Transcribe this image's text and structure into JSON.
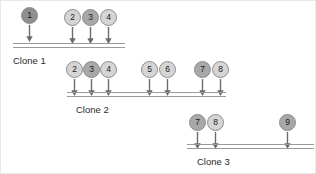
{
  "diagram": {
    "background": "#ffffff",
    "shades": {
      "light": "#d5d5d5",
      "mid": "#a8a8a8",
      "dark": "#8f8f8f",
      "stroke": "#8d8d8d",
      "rail": "#9a9a9a",
      "text": "#2b2b2b"
    },
    "rows": [
      {
        "name": "clone-1",
        "label": "Clone 1",
        "label_x": 12,
        "label_y": 54,
        "rail_x": 12,
        "rail_y": 42,
        "rail_w": 112,
        "nodes": [
          {
            "id": "1",
            "x": 20,
            "y": 6,
            "shade": "dark"
          },
          {
            "id": "2",
            "x": 63,
            "y": 8,
            "shade": "light"
          },
          {
            "id": "3",
            "x": 81,
            "y": 8,
            "shade": "mid"
          },
          {
            "id": "4",
            "x": 99,
            "y": 8,
            "shade": "light"
          }
        ],
        "arrows": [
          {
            "x": 24,
            "y": 24
          },
          {
            "x": 67,
            "y": 26
          },
          {
            "x": 85,
            "y": 26
          },
          {
            "x": 103,
            "y": 26
          }
        ]
      },
      {
        "name": "clone-2",
        "label": "Clone 2",
        "label_x": 75,
        "label_y": 103,
        "rail_x": 66,
        "rail_y": 91,
        "rail_w": 159,
        "nodes": [
          {
            "id": "2",
            "x": 65,
            "y": 60,
            "shade": "light"
          },
          {
            "id": "3",
            "x": 82,
            "y": 60,
            "shade": "mid"
          },
          {
            "id": "4",
            "x": 99,
            "y": 60,
            "shade": "light"
          },
          {
            "id": "5",
            "x": 140,
            "y": 60,
            "shade": "light"
          },
          {
            "id": "6",
            "x": 158,
            "y": 60,
            "shade": "light"
          },
          {
            "id": "7",
            "x": 193,
            "y": 60,
            "shade": "mid"
          },
          {
            "id": "8",
            "x": 211,
            "y": 60,
            "shade": "light"
          }
        ],
        "arrows": [
          {
            "x": 69,
            "y": 78
          },
          {
            "x": 86,
            "y": 78
          },
          {
            "x": 103,
            "y": 78
          },
          {
            "x": 144,
            "y": 78
          },
          {
            "x": 162,
            "y": 78
          },
          {
            "x": 197,
            "y": 78
          },
          {
            "x": 215,
            "y": 78
          }
        ]
      },
      {
        "name": "clone-3",
        "label": "Clone 3",
        "label_x": 196,
        "label_y": 155,
        "rail_x": 186,
        "rail_y": 143,
        "rail_w": 127,
        "nodes": [
          {
            "id": "7",
            "x": 188,
            "y": 113,
            "shade": "mid"
          },
          {
            "id": "8",
            "x": 206,
            "y": 113,
            "shade": "light"
          },
          {
            "id": "9",
            "x": 278,
            "y": 113,
            "shade": "mid"
          }
        ],
        "arrows": [
          {
            "x": 192,
            "y": 131
          },
          {
            "x": 210,
            "y": 131
          },
          {
            "x": 282,
            "y": 131
          }
        ]
      }
    ]
  }
}
